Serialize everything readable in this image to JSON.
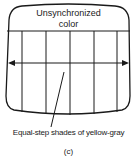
{
  "diagram": {
    "screen_label_line1": "Unsynchronized",
    "screen_label_line2": "color",
    "callout_label": "Equal-step shades of yellow-gray",
    "panel_label": "(c)",
    "stripe_count": 6,
    "colors": {
      "ink": "#1a1a1a",
      "background": "#ffffff"
    }
  }
}
